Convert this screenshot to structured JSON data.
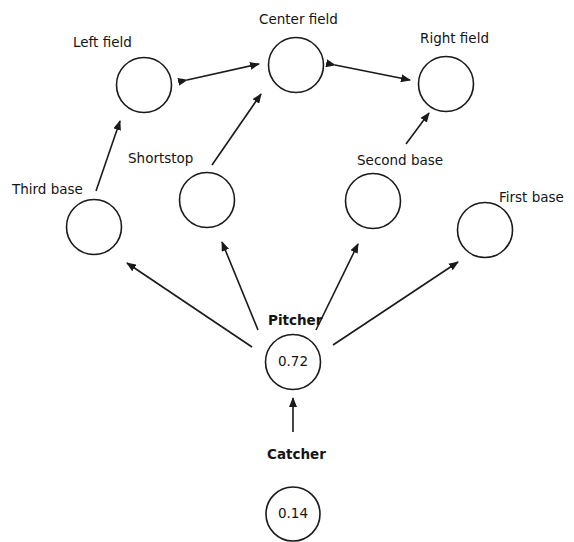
{
  "diagram": {
    "nodes": [
      {
        "id": "left_field",
        "label": "Left field",
        "value": null,
        "bold": false
      },
      {
        "id": "center_field",
        "label": "Center field",
        "value": null,
        "bold": false
      },
      {
        "id": "right_field",
        "label": "Right field",
        "value": null,
        "bold": false
      },
      {
        "id": "third_base",
        "label": "Third base",
        "value": null,
        "bold": false
      },
      {
        "id": "shortstop",
        "label": "Shortstop",
        "value": null,
        "bold": false
      },
      {
        "id": "second_base",
        "label": "Second base",
        "value": null,
        "bold": false
      },
      {
        "id": "first_base",
        "label": "First base",
        "value": null,
        "bold": false
      },
      {
        "id": "pitcher",
        "label": "Pitcher",
        "value": "0.72",
        "bold": true
      },
      {
        "id": "catcher",
        "label": "Catcher",
        "value": "0.14",
        "bold": true
      }
    ],
    "edges": [
      {
        "from": "left_field",
        "to": "center_field",
        "bidirectional": true
      },
      {
        "from": "right_field",
        "to": "center_field",
        "bidirectional": true
      },
      {
        "from": "third_base",
        "to": "left_field",
        "bidirectional": false
      },
      {
        "from": "shortstop",
        "to": "center_field",
        "bidirectional": false
      },
      {
        "from": "second_base",
        "to": "right_field",
        "bidirectional": false
      },
      {
        "from": "pitcher",
        "to": "third_base",
        "bidirectional": false
      },
      {
        "from": "pitcher",
        "to": "shortstop",
        "bidirectional": false
      },
      {
        "from": "pitcher",
        "to": "second_base",
        "bidirectional": false
      },
      {
        "from": "pitcher",
        "to": "first_base",
        "bidirectional": false
      },
      {
        "from": "catcher",
        "to": "pitcher",
        "bidirectional": false
      }
    ],
    "colors": {
      "stroke": "#1a1a1a",
      "background": "#ffffff"
    }
  }
}
